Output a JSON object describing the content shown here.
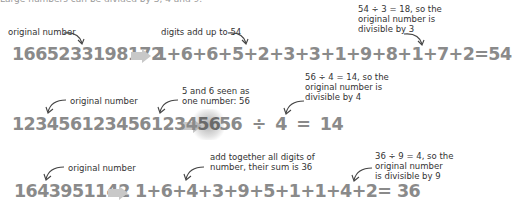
{
  "intro": {
    "text": "Large numbers can be divided by 3, 4 and 9."
  },
  "examples": [
    {
      "id": "div3",
      "original_label": "original number",
      "original_number": "1665233198172",
      "expression": "1+6+6+5+2+3+3+1+9+8+1+7+2",
      "equals": "=",
      "result": "54",
      "middle_note": "digits add up to 54",
      "result_note": [
        "54 ÷ 3 = 18, so the",
        "original number is",
        "divisible by 3"
      ]
    },
    {
      "id": "div4",
      "original_label": "original number",
      "original_number_prefix": "123456123456123 4",
      "original_number_main": "1234561234561234",
      "original_number_highlight": "56",
      "expression": "56 ÷ 4",
      "equals": "=",
      "result": "14",
      "middle_note": [
        "5 and 6 seen as",
        "one number: 56"
      ],
      "result_note": [
        "56 ÷ 4 = 14, so the",
        "original number is",
        "divisible by 4"
      ]
    },
    {
      "id": "div9",
      "original_label": "original number",
      "original_number": "1643951142",
      "expression": "1+6+4+3+9+5+1+1+4+2",
      "equals": "=",
      "result": "36",
      "middle_note": [
        "add together all digits of",
        "number, their sum is 36"
      ],
      "result_note": [
        "36 ÷ 9 = 4, so the",
        "original number",
        "is divisible by 9"
      ]
    }
  ],
  "icons": {
    "arrow": "right-arrow-icon",
    "pointer": "curved-arrow-icon"
  },
  "colors": {
    "number_text": "#8a8a8a",
    "note_text": "#333333",
    "arrow_fill": "#c8c8c8"
  }
}
